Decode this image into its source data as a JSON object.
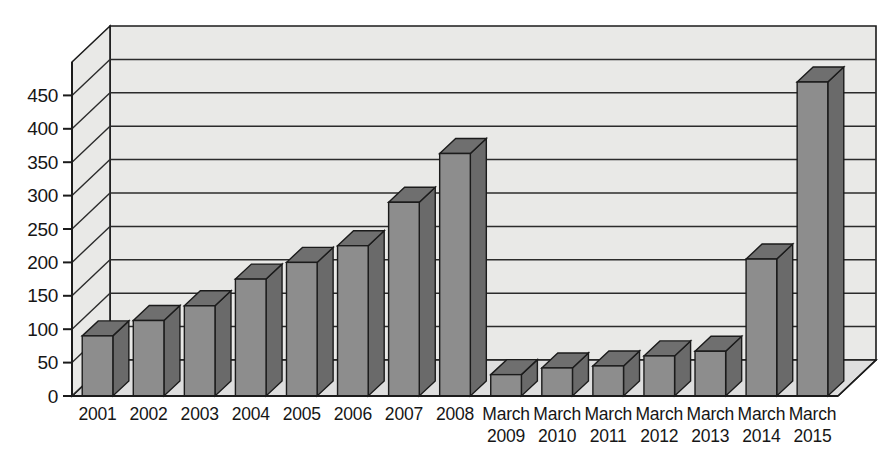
{
  "chart_data": {
    "type": "bar",
    "title": "",
    "subtitle": "",
    "xlabel": "",
    "ylabel": "",
    "categories": [
      "2001",
      "2002",
      "2003",
      "2004",
      "2005",
      "2006",
      "2007",
      "2008",
      "March 2009",
      "March 2010",
      "March 2011",
      "March 2012",
      "March 2013",
      "March 2014",
      "March 2015"
    ],
    "category_lines": [
      [
        "2001",
        ""
      ],
      [
        "2002",
        ""
      ],
      [
        "2003",
        ""
      ],
      [
        "2004",
        ""
      ],
      [
        "2005",
        ""
      ],
      [
        "2006",
        ""
      ],
      [
        "2007",
        ""
      ],
      [
        "2008",
        ""
      ],
      [
        "March",
        "2009"
      ],
      [
        "March",
        "2010"
      ],
      [
        "March",
        "2011"
      ],
      [
        "March",
        "2012"
      ],
      [
        "March",
        "2013"
      ],
      [
        "March",
        "2014"
      ],
      [
        "March",
        "2015"
      ]
    ],
    "values": [
      90,
      113,
      135,
      175,
      200,
      225,
      290,
      363,
      32,
      42,
      45,
      60,
      67,
      205,
      470
    ],
    "ylim": [
      0,
      500
    ],
    "yticks": [
      0,
      50,
      100,
      150,
      200,
      250,
      300,
      350,
      400,
      450
    ],
    "ytick_labels": [
      "0",
      "50",
      "100",
      "150",
      "200",
      "250",
      "300",
      "350",
      "400",
      "450"
    ],
    "grid": true,
    "grid_axis": "y",
    "legend": false,
    "legend_position": "none",
    "style": "3d-column",
    "colors": {
      "bar_front": "#8d8d8d",
      "bar_top": "#6f6f6f",
      "bar_side": "#6a6a6a",
      "bar_outline": "#1b1b1b",
      "plot_background": "#e9e9e7",
      "floor": "#dedede",
      "gridline": "#2b2b2b",
      "axis": "#1b1b1b",
      "text": "#161616",
      "page_background": "#ffffff"
    }
  }
}
